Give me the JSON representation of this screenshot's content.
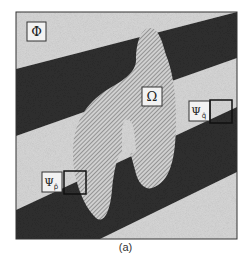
{
  "figure": {
    "caption": "(a)",
    "labels": {
      "phi": "Φ",
      "omega": "Ω",
      "psi_p": "Ψ",
      "psi_p_sub": "p̂",
      "psi_q": "Ψ",
      "psi_q_sub": "q̂"
    },
    "colors": {
      "light_region": "#d9d9d9",
      "dark_band": "#2e2e2e",
      "hatch_fill": "#c8c8c8",
      "hatch_line": "#6a6a6a",
      "frame": "#333333",
      "patch_border": "#111111",
      "label_box": "#f2f2f2"
    }
  }
}
